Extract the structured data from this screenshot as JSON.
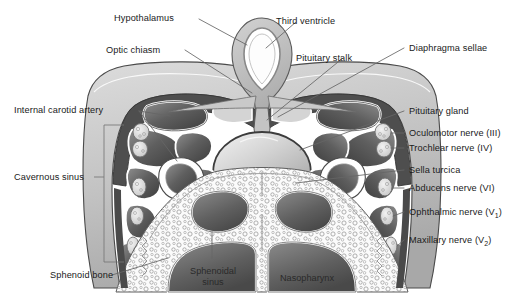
{
  "figure": {
    "background": "#ffffff",
    "line_color": "#555555",
    "text_color": "#1a1a1a"
  },
  "labels": {
    "hypothalamus": "Hypothalamus",
    "third_ventricle": "Third ventricle",
    "optic_chiasm": "Optic chiasm",
    "pituitary_stalk": "Pituitary stalk",
    "diaphragma_sellae": "Diaphragma sellae",
    "internal_carotid_artery": "Internal carotid artery",
    "pituitary_gland": "Pituitary gland",
    "oculomotor_nerve": "Oculomotor nerve (III)",
    "trochlear_nerve": "Trochlear nerve (IV)",
    "sella_turcica": "Sella turcica",
    "abducens_nerve": "Abducens nerve (VI)",
    "ophthalmic_nerve": "Ophthalmic nerve (V",
    "ophthalmic_nerve_sub": "1",
    "ophthalmic_nerve_tail": ")",
    "maxillary_nerve": "Maxillary nerve (V",
    "maxillary_nerve_sub": "2",
    "maxillary_nerve_tail": ")",
    "cavernous_sinus": "Cavernous sinus",
    "sphenoid_bone": "Sphenoid bone",
    "sphenoidal_sinus_line1": "Sphenoidal",
    "sphenoidal_sinus_line2": "sinus",
    "nasopharynx": "Nasopharynx"
  },
  "colors": {
    "tissue_light": "#d6d6d6",
    "tissue_mid": "#b3b3b3",
    "tissue_dark": "#6e6e6e",
    "dura_dark": "#4a4a4a",
    "cavity_dark": "#5a5a5a",
    "outline": "#3a3a3a",
    "white": "#ffffff",
    "leader": "#666666"
  }
}
